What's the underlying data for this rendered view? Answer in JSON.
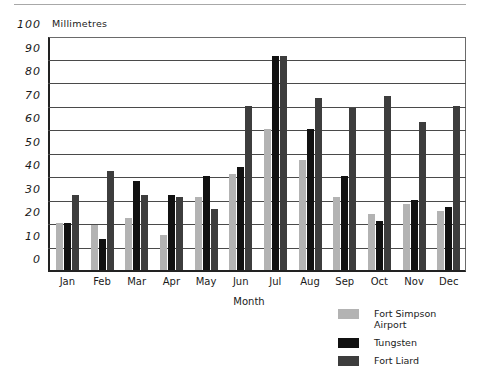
{
  "chart_data": {
    "type": "bar",
    "title": "",
    "xlabel": "Month",
    "ylabel": "Millimetres",
    "ylim": [
      0,
      100
    ],
    "ytick_values": [
      0,
      10,
      20,
      30,
      40,
      50,
      60,
      70,
      80,
      90,
      100
    ],
    "ytick_labels": [
      "0",
      "10",
      "20",
      "30",
      "40",
      "50",
      "60",
      "70",
      "80",
      "90",
      "100"
    ],
    "grid": true,
    "legend_position": "bottom-right",
    "categories": [
      "Jan",
      "Feb",
      "Mar",
      "Apr",
      "May",
      "Jun",
      "Jul",
      "Aug",
      "Sep",
      "Oct",
      "Nov",
      "Dec"
    ],
    "series": [
      {
        "name": "Fort Simpson\nAirport",
        "color": "#b3b3b3",
        "values": [
          20,
          19,
          22,
          15,
          31,
          41,
          60,
          47,
          31,
          24,
          28,
          25
        ]
      },
      {
        "name": "Tungsten",
        "color": "#111111",
        "values": [
          20,
          13,
          38,
          32,
          40,
          44,
          91,
          60,
          40,
          21,
          30,
          27
        ]
      },
      {
        "name": "Fort Liard",
        "color": "#3d3d3d",
        "values": [
          32,
          42,
          32,
          31,
          26,
          70,
          91,
          73,
          69,
          74,
          63,
          70
        ]
      }
    ]
  }
}
